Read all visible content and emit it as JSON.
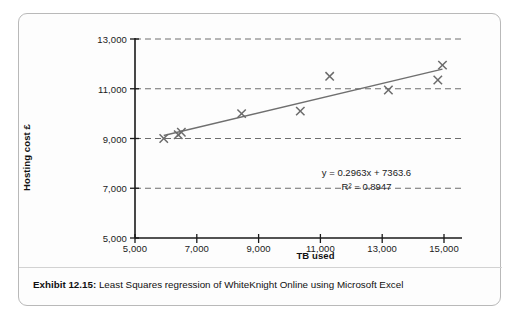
{
  "figure": {
    "caption_label": "Exhibit 12.15:",
    "caption_text": "Least Squares regression of WhiteKnight Online using Microsoft Excel"
  },
  "annotation": {
    "equation": "y = 0.2963x + 7363.6",
    "r_squared": "R² = 0.8947"
  },
  "chart_data": {
    "type": "scatter",
    "title": "",
    "subtitle": "",
    "xlabel": "TB used",
    "ylabel": "Hosting cost £",
    "xlim": [
      5000,
      15000
    ],
    "ylim": [
      5000,
      13000
    ],
    "xticks": [
      5000,
      7000,
      9000,
      11000,
      13000,
      15000
    ],
    "yticks": [
      5000,
      7000,
      9000,
      11000,
      13000
    ],
    "xtick_labels": [
      "5,000",
      "7,000",
      "9,000",
      "11,000",
      "13,000",
      "15,000"
    ],
    "ytick_labels": [
      "5,000",
      "7,000",
      "9,000",
      "11,000",
      "13,000"
    ],
    "grid": "horizontal-dashed",
    "gridlines_y": [
      7000,
      9000,
      11000,
      13000
    ],
    "legend": "none",
    "marker": "x-cross",
    "marker_color": "#6b6b6b",
    "line_color": "#6f6f6f",
    "axis_color": "#1a1a1a",
    "series": [
      {
        "name": "Hosting cost",
        "x": [
          5930,
          6400,
          6500,
          8450,
          10350,
          11300,
          13200,
          14800,
          14950
        ],
        "y": [
          9000,
          9150,
          9250,
          10000,
          10100,
          11500,
          10950,
          11350,
          11950
        ]
      }
    ],
    "trendline": {
      "type": "linear-least-squares",
      "slope": 0.2963,
      "intercept": 7363.6,
      "r_squared": 0.8947,
      "equation_label": "y = 0.2963x + 7363.6",
      "r_squared_label": "R² = 0.8947",
      "x_start": 5930,
      "x_end": 14950
    }
  }
}
